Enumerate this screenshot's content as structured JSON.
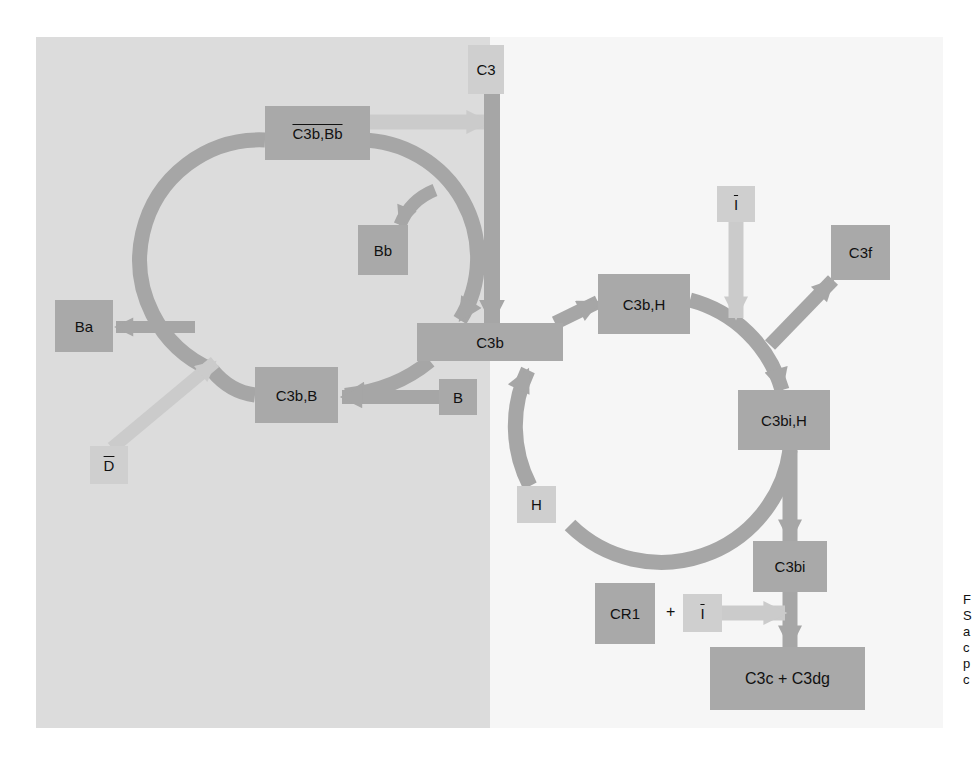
{
  "diagram": {
    "colors": {
      "left_panel": "#dcdcdc",
      "right_panel": "#f6f6f6",
      "dark_node": "#a9a9a9",
      "light_node": "#cfcfcf",
      "dark_link": "#a6a6a6",
      "light_link": "#cbcbcb"
    },
    "nodes": {
      "c3": "C3",
      "c3b_bb": "C3b,Bb",
      "bb": "Bb",
      "ba": "Ba",
      "c3b_b": "C3b,B",
      "d": "D",
      "c3b": "C3b",
      "b": "B",
      "c3b_h": "C3b,H",
      "i_top": "I",
      "c3f": "C3f",
      "c3bi_h": "C3bi,H",
      "h": "H",
      "c3bi": "C3bi",
      "cr1": "CR1",
      "plus": "+",
      "i_bottom": "I",
      "c3c_c3dg": "C3c + C3dg"
    },
    "edges": [
      {
        "from": "C3b,Bb",
        "to": "C3",
        "style": "light"
      },
      {
        "from": "C3",
        "to": "C3b",
        "style": "dark"
      },
      {
        "from": "C3b",
        "to": "C3b,B",
        "style": "dark"
      },
      {
        "from": "B",
        "to": "C3b,B",
        "style": "dark"
      },
      {
        "from": "C3b,B",
        "to": "Ba",
        "style": "dark"
      },
      {
        "from": "D",
        "to": "C3b,B",
        "style": "light"
      },
      {
        "from": "C3b,B",
        "to": "C3b,Bb",
        "style": "dark"
      },
      {
        "from": "C3b,Bb",
        "to": "Bb",
        "style": "dark"
      },
      {
        "from": "C3b,Bb",
        "to": "C3b",
        "style": "dark"
      },
      {
        "from": "C3b",
        "to": "C3b,H",
        "style": "dark"
      },
      {
        "from": "H",
        "to": "C3b,H",
        "style": "dark"
      },
      {
        "from": "C3b,H",
        "to": "C3bi,H",
        "style": "dark"
      },
      {
        "from": "I",
        "to": "C3bi,H",
        "style": "light"
      },
      {
        "from": "C3bi,H",
        "to": "C3f",
        "style": "dark"
      },
      {
        "from": "C3bi,H",
        "to": "H",
        "style": "dark"
      },
      {
        "from": "C3bi,H",
        "to": "C3bi",
        "style": "dark"
      },
      {
        "from": "C3bi",
        "to": "C3c + C3dg",
        "style": "dark"
      },
      {
        "from": "CR1 + I",
        "to": "C3c + C3dg",
        "style": "light"
      }
    ],
    "caption_fragment": [
      "F",
      "S",
      "a",
      "c",
      "p",
      "c"
    ]
  }
}
